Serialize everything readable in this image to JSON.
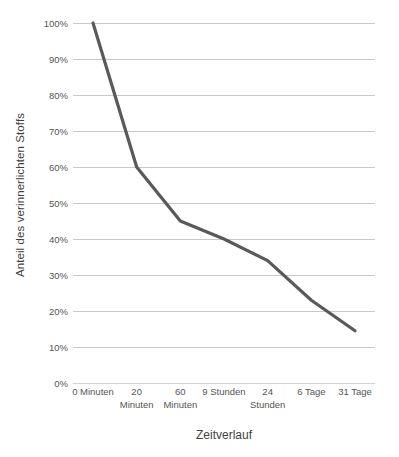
{
  "chart_data": {
    "type": "line",
    "title": "",
    "xlabel": "Zeitverlauf",
    "ylabel": "Anteil des verinnerlichten Stoffs",
    "categories": [
      "0 Minuten",
      "20 Minuten",
      "60 Minuten",
      "9 Stunden",
      "24 Stunden",
      "6 Tage",
      "31 Tage"
    ],
    "category_lines": [
      [
        "0 Minuten",
        ""
      ],
      [
        "20",
        "Minuten"
      ],
      [
        "60",
        "Minuten"
      ],
      [
        "9 Stunden",
        ""
      ],
      [
        "24",
        "Stunden"
      ],
      [
        "6 Tage",
        ""
      ],
      [
        "31 Tage",
        ""
      ]
    ],
    "values": [
      100,
      60,
      45,
      40,
      34,
      23,
      14.5
    ],
    "value_labels": [
      "100%",
      "60%",
      "45%",
      "40%",
      "34%",
      "23%",
      "14.5%"
    ],
    "series": [
      {
        "name": "Anteil des verinnerlichten Stoffs",
        "values": [
          100,
          60,
          45,
          40,
          34,
          23,
          14.5
        ],
        "color": "#595959",
        "line_width": 3.2
      }
    ],
    "ylim": [
      0,
      100
    ],
    "ytick_labels": [
      "100%",
      "90%",
      "80%",
      "70%",
      "60%",
      "50%",
      "40%",
      "30%",
      "20%",
      "10%",
      "0%"
    ],
    "ytick_values": [
      100,
      90,
      80,
      70,
      60,
      50,
      40,
      30,
      20,
      10,
      0
    ],
    "grid": true,
    "grid_axis": "y",
    "grid_color": "#c8c8c8",
    "legend": false,
    "legend_position": "none",
    "background_color": "#ffffff",
    "tick_label_color": "#555555",
    "axis_title_color": "#3f3f3f"
  }
}
